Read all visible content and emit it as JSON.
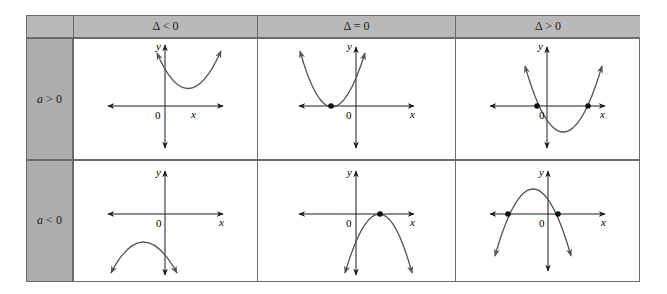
{
  "table": {
    "corner": "",
    "columns": [
      {
        "label": "Δ < 0"
      },
      {
        "label": "Δ = 0"
      },
      {
        "label": "Δ > 0"
      }
    ],
    "rows": [
      {
        "label_var": "a",
        "label_rest": " > 0"
      },
      {
        "label_var": "a",
        "label_rest": " < 0"
      }
    ],
    "axis_labels": {
      "x": "x",
      "y": "y",
      "origin": "0"
    },
    "cells": [
      [
        {
          "description": "Upward parabola entirely above x-axis, no real roots"
        },
        {
          "description": "Upward parabola tangent to x-axis, one double root"
        },
        {
          "description": "Upward parabola crossing x-axis at two roots"
        }
      ],
      [
        {
          "description": "Downward parabola entirely below x-axis, no real roots"
        },
        {
          "description": "Downward parabola tangent to x-axis, one double root"
        },
        {
          "description": "Downward parabola crossing x-axis at two roots"
        }
      ]
    ]
  },
  "colors": {
    "header_bg": "#b9b9b9",
    "row_label_bg": "#adadad",
    "border": "#6b6b6b",
    "curve": "#555555",
    "axis": "#1a1a1a"
  }
}
